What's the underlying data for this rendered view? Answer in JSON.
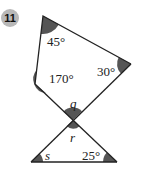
{
  "problem": {
    "number": "11",
    "badge_color": "#b8b8b8"
  },
  "figure": {
    "shade_color": "#555555",
    "line_color": "#222222",
    "angles": {
      "top": "45°",
      "right": "30°",
      "left": "170°",
      "upper_vertical": "q",
      "lower_vertical": "r",
      "bottom_left": "s",
      "bottom_right": "25°"
    }
  }
}
